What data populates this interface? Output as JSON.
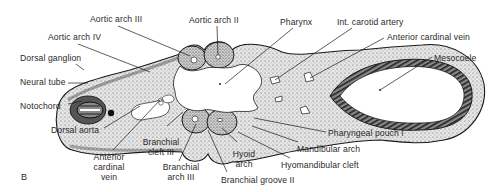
{
  "figure": {
    "letter": "B",
    "labels": {
      "aortic_arch_iii": "Aortic arch III",
      "aortic_arch_ii": "Aortic arch II",
      "aortic_arch_iv": "Aortic arch IV",
      "dorsal_ganglion": "Dorsal ganglion",
      "neural_tube": "Neural tube",
      "notochord": "Notochord",
      "dorsal_aorta": "Dorsal aorta",
      "anterior_cardinal_vein_left_1": "Anterior",
      "anterior_cardinal_vein_left_2": "cardinal",
      "anterior_cardinal_vein_left_3": "vein",
      "branchial_cleft_iii_1": "Branchial",
      "branchial_cleft_iii_2": "cleft III",
      "branchial_arch_iii_1": "Branchial",
      "branchial_arch_iii_2": "arch III",
      "branchial_groove_ii": "Branchial groove II",
      "hyoid_arch_1": "Hyoid",
      "hyoid_arch_2": "arch",
      "hyomandibular_cleft": "Hyomandibular cleft",
      "mandibular_arch": "Mandibular arch",
      "pharyngeal_pouch_i": "Pharyngeal pouch I",
      "pharynx": "Pharynx",
      "int_carotid_artery": "Int. carotid artery",
      "anterior_cardinal_vein_right": "Anterior cardinal vein",
      "mesocoele": "Mesocoele"
    }
  },
  "colors": {
    "ink": "#1a1a1a",
    "tissue": "#c8c8c8",
    "paper": "#ffffff"
  }
}
